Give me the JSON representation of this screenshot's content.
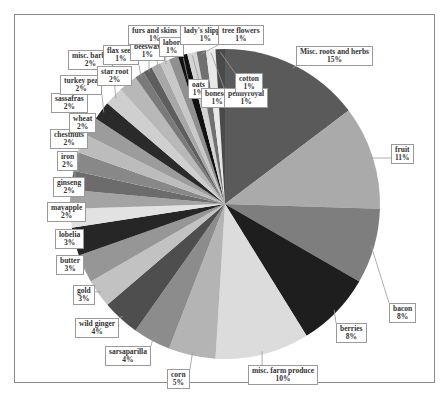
{
  "chart_data": {
    "type": "pie",
    "title": "",
    "start_angle_deg": 0,
    "direction": "clockwise",
    "categories": [
      "Misc. roots and herbs",
      "fruit",
      "bacon",
      "berries",
      "misc. farm produce",
      "corn",
      "sarsaparilla",
      "wild ginger",
      "gold",
      "butter",
      "lobelia",
      "mayapple",
      "ginseng",
      "iron",
      "chestnuts",
      "wheat",
      "sassafras",
      "turkey pea",
      "misc. barks",
      "star root",
      "flax seed",
      "beeswax",
      "furs and skins",
      "labor",
      "lady's slipper",
      "oats",
      "boneset",
      "tree flowers",
      "pennyroyal",
      "cotton"
    ],
    "values": [
      15,
      11,
      8,
      8,
      10,
      5,
      4,
      4,
      3,
      3,
      3,
      2,
      2,
      2,
      2,
      2,
      2,
      2,
      2,
      2,
      1,
      1,
      1,
      1,
      1,
      1,
      1,
      1,
      1,
      1
    ],
    "labels": [
      "15%",
      "11%",
      "8%",
      "8%",
      "10%",
      "5%",
      "4%",
      "4%",
      "3%",
      "3%",
      "3%",
      "2%",
      "2%",
      "2%",
      "2%",
      "2%",
      "2%",
      "2%",
      "2%",
      "2%",
      "1%",
      "1%",
      "1%",
      "1%",
      "1%",
      "1%",
      "1%",
      "1%",
      "1%",
      "1%"
    ],
    "colors": [
      "#5a5a5a",
      "#aaaaaa",
      "#7e7e7e",
      "#1e1e1e",
      "#dcdcdc",
      "#b4b4b4",
      "#8c8c8c",
      "#4e4e4e",
      "#c2c2c2",
      "#969696",
      "#262626",
      "#e2e2e2",
      "#a4a4a4",
      "#6c6c6c",
      "#888888",
      "#bcbcbc",
      "#9c9c9c",
      "#2a2a2a",
      "#cfcfcf",
      "#b8b8b8",
      "#7a7a7a",
      "#5e5e5e",
      "#a8a8a8",
      "#c8c8c8",
      "#909090",
      "#111111",
      "#d4d4d4",
      "#707070",
      "#e8e8e8",
      "#4a4a4a"
    ],
    "legend": "none",
    "data_labels": "category name and percentage in callout boxes"
  },
  "label_positions": [
    {
      "x": 296,
      "y": 46
    },
    {
      "x": 391,
      "y": 144
    },
    {
      "x": 389,
      "y": 303
    },
    {
      "x": 336,
      "y": 323
    },
    {
      "x": 248,
      "y": 365
    },
    {
      "x": 167,
      "y": 369
    },
    {
      "x": 105,
      "y": 346
    },
    {
      "x": 75,
      "y": 318
    },
    {
      "x": 73,
      "y": 285
    },
    {
      "x": 56,
      "y": 255
    },
    {
      "x": 55,
      "y": 229
    },
    {
      "x": 47,
      "y": 202
    },
    {
      "x": 53,
      "y": 177
    },
    {
      "x": 57,
      "y": 151
    },
    {
      "x": 50,
      "y": 129
    },
    {
      "x": 69,
      "y": 113
    },
    {
      "x": 51,
      "y": 93
    },
    {
      "x": 60,
      "y": 75
    },
    {
      "x": 68,
      "y": 50
    },
    {
      "x": 97,
      "y": 66
    },
    {
      "x": 103,
      "y": 45
    },
    {
      "x": 130,
      "y": 41
    },
    {
      "x": 128,
      "y": 25
    },
    {
      "x": 159,
      "y": 37
    },
    {
      "x": 180,
      "y": 25
    },
    {
      "x": 188,
      "y": 79
    },
    {
      "x": 201,
      "y": 88
    },
    {
      "x": 218,
      "y": 25
    },
    {
      "x": 224,
      "y": 88
    },
    {
      "x": 235,
      "y": 73
    }
  ]
}
